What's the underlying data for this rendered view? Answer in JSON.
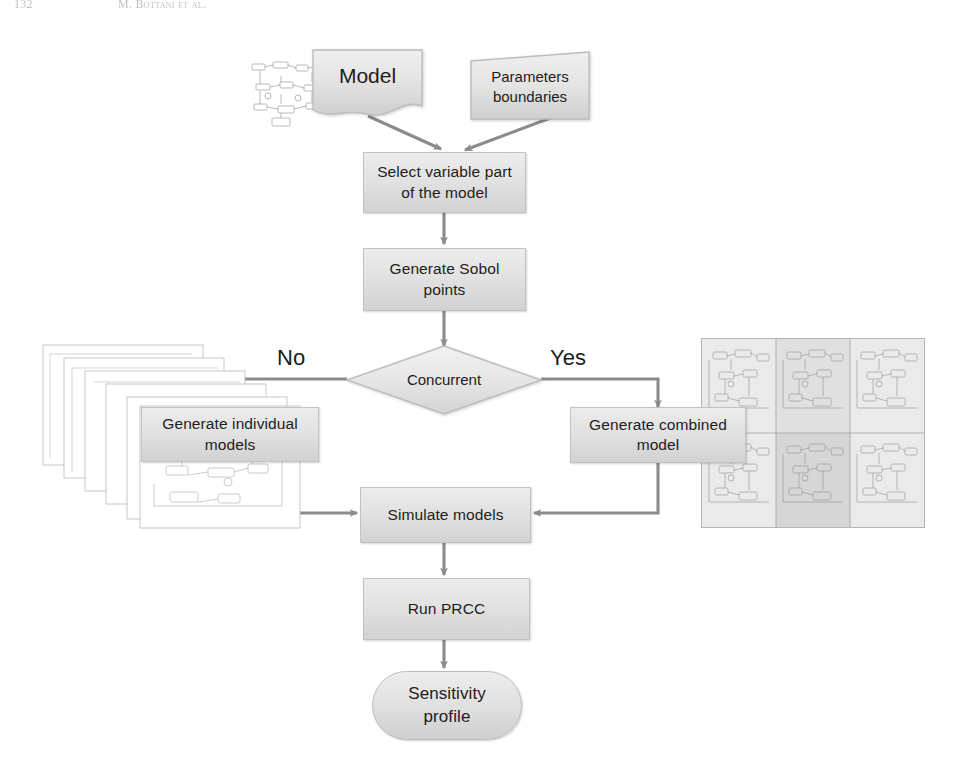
{
  "running_head": {
    "folio": "132",
    "authors": "M. Bottani et al."
  },
  "diagram": {
    "colors": {
      "node_fill_top": "#ececec",
      "node_fill_bottom": "#d2d2d2",
      "node_border": "#c2c2c2",
      "connector": "#8b8b8b",
      "text": "#1d1d1b"
    },
    "nodes": {
      "model": {
        "label": "Model",
        "shape": "document"
      },
      "parameters": {
        "label_line1": "Parameters",
        "label_line2": "boundaries",
        "shape": "trapezoid"
      },
      "select_variable": {
        "label_line1": "Select variable part",
        "label_line2": "of the model",
        "shape": "process"
      },
      "generate_sobol": {
        "label_line1": "Generate Sobol",
        "label_line2": "points",
        "shape": "process"
      },
      "concurrent": {
        "label": "Concurrent",
        "shape": "decision"
      },
      "generate_individual": {
        "label_line1": "Generate individual",
        "label_line2": "models",
        "shape": "process"
      },
      "generate_combined": {
        "label_line1": "Generate combined",
        "label_line2": "model",
        "shape": "process"
      },
      "simulate": {
        "label": "Simulate models",
        "shape": "process"
      },
      "run_prcc": {
        "label": "Run PRCC",
        "shape": "process"
      },
      "sensitivity": {
        "label_line1": "Sensitivity",
        "label_line2": "profile",
        "shape": "terminator"
      }
    },
    "branches": {
      "no": "No",
      "yes": "Yes"
    },
    "images": {
      "model_thumbnail": "model-block-diagram-thumbnail",
      "individual_models_stack": "stacked-model-diagrams-thumbnail",
      "combined_model_grid": "tiled-model-diagrams-grid-thumbnail"
    }
  }
}
